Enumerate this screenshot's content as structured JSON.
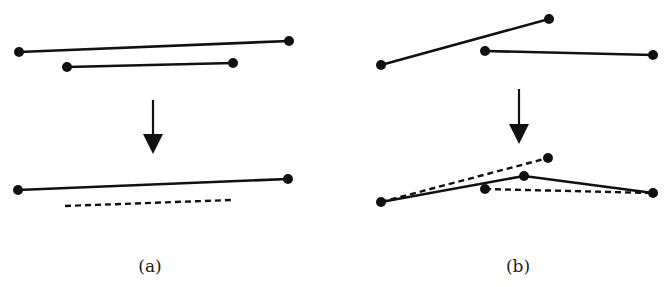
{
  "figure": {
    "style": {
      "stroke": "#111111",
      "background": "#ffffff",
      "stroke_width": 2.6,
      "dot_radius": 5
    },
    "panels": [
      {
        "id": "a",
        "caption": "(a)",
        "caption_pos": [
          150,
          258
        ],
        "before": {
          "segments": [
            {
              "from": [
                19,
                52
              ],
              "to": [
                289,
                41
              ],
              "dashed": false,
              "dots": true
            },
            {
              "from": [
                67,
                67
              ],
              "to": [
                233,
                63
              ],
              "dashed": false,
              "dots": true
            }
          ]
        },
        "arrow": {
          "x": 153,
          "y1": 100,
          "y2": 154
        },
        "after": {
          "segments": [
            {
              "from": [
                18,
                190
              ],
              "to": [
                288,
                179
              ],
              "dashed": false,
              "dots": true
            },
            {
              "from": [
                65,
                206
              ],
              "to": [
                231,
                200
              ],
              "dashed": true,
              "dots": false
            }
          ]
        }
      },
      {
        "id": "b",
        "caption": "(b)",
        "caption_pos": [
          518,
          258
        ],
        "before": {
          "segments": [
            {
              "from": [
                381,
                65
              ],
              "to": [
                549,
                19
              ],
              "dashed": false,
              "dots": true
            },
            {
              "from": [
                485,
                51
              ],
              "to": [
                653,
                55
              ],
              "dashed": false,
              "dots": true
            }
          ]
        },
        "arrow": {
          "x": 519,
          "y1": 89,
          "y2": 144
        },
        "after": {
          "segments": [
            {
              "from": [
                381,
                202
              ],
              "to": [
                548,
                158
              ],
              "dashed": true,
              "dots": false
            },
            {
              "from": [
                485,
                189
              ],
              "to": [
                653,
                193
              ],
              "dashed": true,
              "dots": false
            },
            {
              "from": [
                381,
                202
              ],
              "to": [
                524,
                176
              ],
              "dashed": false,
              "dots": false
            },
            {
              "from": [
                524,
                176
              ],
              "to": [
                653,
                193
              ],
              "dashed": false,
              "dots": false
            }
          ],
          "points": [
            [
              381,
              202
            ],
            [
              548,
              158
            ],
            [
              485,
              189
            ],
            [
              524,
              176
            ],
            [
              653,
              193
            ]
          ]
        }
      }
    ]
  }
}
